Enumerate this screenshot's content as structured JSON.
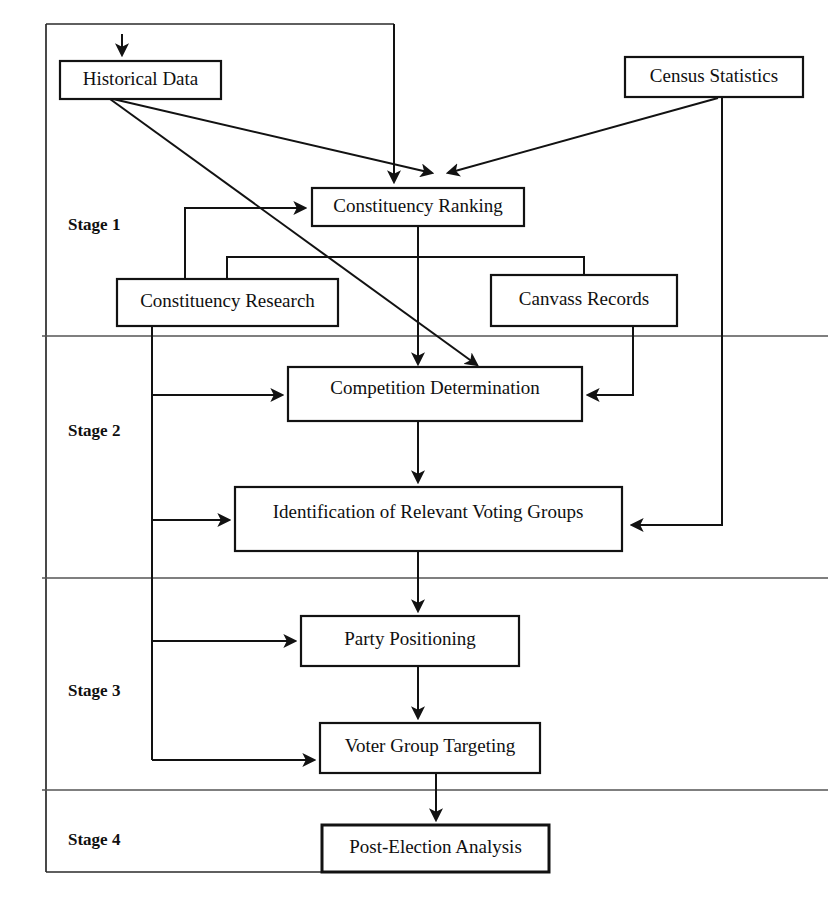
{
  "diagram": {
    "stages": [
      {
        "id": "stage-1",
        "label": "Stage 1"
      },
      {
        "id": "stage-2",
        "label": "Stage 2"
      },
      {
        "id": "stage-3",
        "label": "Stage 3"
      },
      {
        "id": "stage-4",
        "label": "Stage 4"
      }
    ],
    "nodes": [
      {
        "id": "historical-data",
        "label": "Historical Data",
        "stage": "Stage 1"
      },
      {
        "id": "census-statistics",
        "label": "Census Statistics",
        "stage": "Stage 1"
      },
      {
        "id": "constituency-ranking",
        "label": "Constituency Ranking",
        "stage": "Stage 1"
      },
      {
        "id": "constituency-research",
        "label": "Constituency Research",
        "stage": "Stage 1"
      },
      {
        "id": "canvass-records",
        "label": "Canvass Records",
        "stage": "Stage 1"
      },
      {
        "id": "competition-determination",
        "label": "Competition Determination",
        "stage": "Stage 2"
      },
      {
        "id": "identification-of-relevant-voting-groups",
        "label": "Identification of Relevant Voting Groups",
        "stage": "Stage 2"
      },
      {
        "id": "party-positioning",
        "label": "Party Positioning",
        "stage": "Stage 3"
      },
      {
        "id": "voter-group-targeting",
        "label": "Voter Group Targeting",
        "stage": "Stage 3"
      },
      {
        "id": "post-election-analysis",
        "label": "Post-Election Analysis",
        "stage": "Stage 4"
      }
    ],
    "edges": [
      {
        "from": "external-input",
        "to": "historical-data"
      },
      {
        "from": "historical-data",
        "to": "constituency-ranking"
      },
      {
        "from": "historical-data",
        "to": "competition-determination"
      },
      {
        "from": "census-statistics",
        "to": "constituency-ranking"
      },
      {
        "from": "census-statistics",
        "to": "identification-of-relevant-voting-groups"
      },
      {
        "from": "outer-frame",
        "to": "constituency-ranking"
      },
      {
        "from": "constituency-ranking",
        "to": "constituency-research"
      },
      {
        "from": "constituency-ranking",
        "to": "canvass-records"
      },
      {
        "from": "constituency-ranking",
        "to": "competition-determination"
      },
      {
        "from": "constituency-research",
        "to": "constituency-ranking"
      },
      {
        "from": "constituency-research",
        "to": "competition-determination"
      },
      {
        "from": "constituency-research",
        "to": "identification-of-relevant-voting-groups"
      },
      {
        "from": "constituency-research",
        "to": "party-positioning"
      },
      {
        "from": "constituency-research",
        "to": "voter-group-targeting"
      },
      {
        "from": "canvass-records",
        "to": "competition-determination"
      },
      {
        "from": "competition-determination",
        "to": "identification-of-relevant-voting-groups"
      },
      {
        "from": "identification-of-relevant-voting-groups",
        "to": "party-positioning"
      },
      {
        "from": "party-positioning",
        "to": "voter-group-targeting"
      },
      {
        "from": "voter-group-targeting",
        "to": "post-election-analysis"
      }
    ],
    "colors": {
      "background": "#ffffff",
      "stroke": "#121212",
      "frame": "#2a2a2a",
      "divider": "#555555",
      "text": "#101010"
    }
  }
}
